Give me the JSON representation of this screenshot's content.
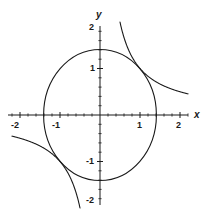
{
  "chart_data": {
    "type": "line",
    "title": "",
    "subtitle": "",
    "xlabel": "x",
    "ylabel": "y",
    "xlim": [
      -2.2,
      2.2
    ],
    "ylim": [
      -2.2,
      2.2
    ],
    "grid": false,
    "legend": null,
    "axis_style": "centered-cross",
    "x_ticks_major": [
      -2,
      -1,
      1,
      2
    ],
    "y_ticks_major": [
      -2,
      -1,
      1,
      2
    ],
    "x_tick_labels": [
      "-2",
      "-1",
      "1",
      "2"
    ],
    "y_tick_labels": [
      "-2",
      "-1",
      "1",
      "2"
    ],
    "minor_tick_spacing": 0.2,
    "series": [
      {
        "name": "circle",
        "equation": "x^2 + y^2 = 2",
        "shape": "circle",
        "center": [
          0,
          0
        ],
        "radius": 1.41,
        "color": "#1a1a1a",
        "linewidth": 1.1
      },
      {
        "name": "hyperbola-branch-1",
        "equation": "x*y = 1",
        "shape": "hyperbola",
        "quadrant": 1,
        "constant": 1,
        "x_range": [
          0.5,
          2.2
        ],
        "color": "#1a1a1a",
        "linewidth": 1.1
      },
      {
        "name": "hyperbola-branch-2",
        "equation": "x*y = 1",
        "shape": "hyperbola",
        "quadrant": 3,
        "constant": 1,
        "x_range": [
          -2.2,
          -0.5
        ],
        "color": "#1a1a1a",
        "linewidth": 1.1
      }
    ],
    "intersections": [
      [
        1.0,
        1.0
      ],
      [
        -1.0,
        -1.0
      ]
    ],
    "colors": {
      "curve": "#1a1a1a",
      "axis": "#1a1a1a",
      "background": "#ffffff",
      "text": "#1a1a1a"
    }
  },
  "labels": {
    "x_axis": "x",
    "y_axis": "y",
    "x_neg2": "-2",
    "x_neg1": "-1",
    "x_pos1": "1",
    "x_pos2": "2",
    "y_neg2": "-2",
    "y_neg1": "-1",
    "y_pos1": "1",
    "y_pos2": "2"
  }
}
